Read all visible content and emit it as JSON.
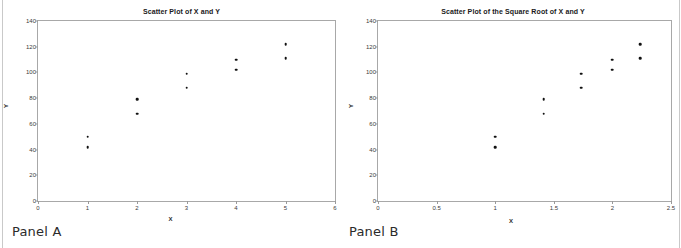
{
  "page": {
    "background": "#ffffff",
    "dot_color": "#111111",
    "axis_color": "#9a9a9a"
  },
  "panels": [
    {
      "caption": "Panel A",
      "chart_data": {
        "type": "scatter",
        "title": "Scatter Plot of X and Y",
        "xlabel": "X",
        "ylabel": "Y",
        "xlim": [
          0,
          6
        ],
        "ylim": [
          0,
          140
        ],
        "xticks": [
          "0",
          "1",
          "2",
          "3",
          "4",
          "5",
          "6"
        ],
        "xtick_values": [
          0,
          1,
          2,
          3,
          4,
          5,
          6
        ],
        "yticks": [
          "0",
          "20",
          "40",
          "60",
          "80",
          "100",
          "120",
          "140"
        ],
        "ytick_values": [
          0,
          20,
          40,
          60,
          80,
          100,
          120,
          140
        ],
        "grid": false,
        "legend": null,
        "x": [
          1,
          1,
          2,
          2,
          3,
          3,
          4,
          4,
          5,
          5
        ],
        "y": [
          50,
          42,
          79,
          68,
          99,
          88,
          110,
          102,
          122,
          111
        ],
        "points": [
          {
            "x": 1,
            "y": 50
          },
          {
            "x": 1,
            "y": 42
          },
          {
            "x": 2,
            "y": 79
          },
          {
            "x": 2,
            "y": 68
          },
          {
            "x": 3,
            "y": 99
          },
          {
            "x": 3,
            "y": 88
          },
          {
            "x": 4,
            "y": 110
          },
          {
            "x": 4,
            "y": 102
          },
          {
            "x": 5,
            "y": 122
          },
          {
            "x": 5,
            "y": 111
          }
        ]
      }
    },
    {
      "caption": "Panel B",
      "chart_data": {
        "type": "scatter",
        "title": "Scatter Plot of the Square Root of X and Y",
        "xlabel": "X",
        "ylabel": "Y",
        "xlim": [
          0,
          2.5
        ],
        "ylim": [
          0,
          140
        ],
        "xticks": [
          "0",
          "0.5",
          "1",
          "1.5",
          "2",
          "2.5"
        ],
        "xtick_values": [
          0,
          0.5,
          1,
          1.5,
          2,
          2.5
        ],
        "yticks": [
          "0",
          "20",
          "40",
          "60",
          "80",
          "100",
          "120",
          "140"
        ],
        "ytick_values": [
          0,
          20,
          40,
          60,
          80,
          100,
          120,
          140
        ],
        "grid": false,
        "legend": null,
        "x": [
          1,
          1,
          1.414,
          1.414,
          1.732,
          1.732,
          2,
          2,
          2.236,
          2.236
        ],
        "y": [
          50,
          42,
          79,
          68,
          99,
          88,
          110,
          102,
          122,
          111
        ],
        "points": [
          {
            "x": 1,
            "y": 50
          },
          {
            "x": 1,
            "y": 42
          },
          {
            "x": 1.414,
            "y": 79
          },
          {
            "x": 1.414,
            "y": 68
          },
          {
            "x": 1.732,
            "y": 99
          },
          {
            "x": 1.732,
            "y": 88
          },
          {
            "x": 2,
            "y": 110
          },
          {
            "x": 2,
            "y": 102
          },
          {
            "x": 2.236,
            "y": 122
          },
          {
            "x": 2.236,
            "y": 111
          }
        ]
      }
    }
  ]
}
